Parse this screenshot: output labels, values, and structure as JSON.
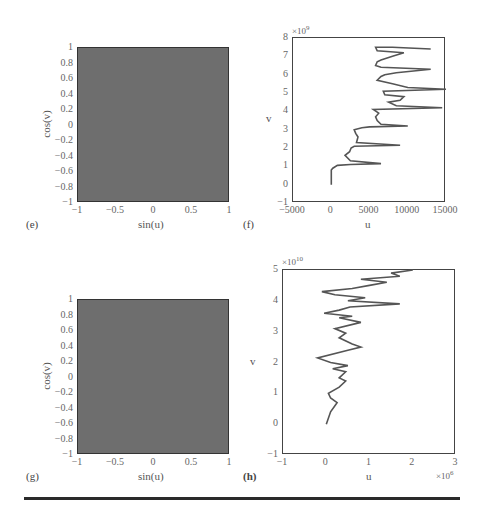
{
  "figure": {
    "panels": [
      {
        "id": "e",
        "label": "(e)",
        "xlabel": "sin(u)",
        "ylabel": "cos(v)",
        "xticks": [
          "−1",
          "−0.5",
          "0",
          "0.5",
          "1"
        ],
        "yticks": [
          "1",
          "0.8",
          "0.6",
          "0.4",
          "0.2",
          "0",
          "−0.2",
          "−0.4",
          "−0.6",
          "−0.8",
          "−1"
        ]
      },
      {
        "id": "f",
        "label": "(f)",
        "xlabel": "u",
        "ylabel": "v",
        "ymultiplier": "×10",
        "ymultiplier_exp": "9",
        "xticks": [
          "−5000",
          "0",
          "5000",
          "10000",
          "15000"
        ],
        "yticks": [
          "8",
          "7",
          "6",
          "5",
          "4",
          "3",
          "2",
          "1",
          "0",
          "−1"
        ]
      },
      {
        "id": "g",
        "label": "(g)",
        "xlabel": "sin(u)",
        "ylabel": "cos(v)",
        "xticks": [
          "−1",
          "−0.5",
          "0",
          "0.5",
          "1"
        ],
        "yticks": [
          "1",
          "0.8",
          "0.6",
          "0.4",
          "0.2",
          "0",
          "−0.2",
          "−0.4",
          "−0.6",
          "−0.8",
          "−1"
        ]
      },
      {
        "id": "h",
        "label": "(h)",
        "xlabel": "u",
        "ylabel": "v",
        "ymultiplier": "×10",
        "ymultiplier_exp": "10",
        "xmultiplier": "×10",
        "xmultiplier_exp": "6",
        "xticks": [
          "−1",
          "0",
          "1",
          "2",
          "3"
        ],
        "yticks": [
          "5",
          "4",
          "3",
          "2",
          "1",
          "0",
          "−1"
        ]
      }
    ]
  },
  "chart_data": [
    {
      "type": "heatmap",
      "panel": "(e)",
      "title": "",
      "xlabel": "sin(u)",
      "ylabel": "cos(v)",
      "xlim": [
        -1,
        1
      ],
      "ylim": [
        -1,
        1
      ],
      "description": "densely filled square (uniform gray)",
      "fill_color": "#6e6e6e"
    },
    {
      "type": "line",
      "panel": "(f)",
      "title": "",
      "xlabel": "u",
      "ylabel": "v (×10^9)",
      "xlim": [
        -5000,
        15000
      ],
      "ylim": [
        -1,
        8
      ],
      "x": [
        0,
        0,
        0,
        200,
        800,
        2500,
        6500,
        2500,
        1800,
        2400,
        2600,
        3000,
        9000,
        3300,
        3500,
        3200,
        3000,
        4000,
        5000,
        10000,
        6500,
        6000,
        5800,
        6200,
        5500,
        14500,
        8500,
        7500,
        9000,
        9500,
        7000,
        6800,
        15000,
        10000,
        8000,
        6000,
        6500,
        7000,
        8500,
        13000,
        6500,
        5800,
        6000,
        6500,
        8000,
        9500,
        6000,
        5800,
        8000,
        13000
      ],
      "y": [
        0,
        0.5,
        0.8,
        0.9,
        1.05,
        1.1,
        1.15,
        1.3,
        1.6,
        1.8,
        2.0,
        2.1,
        2.15,
        2.3,
        2.6,
        2.8,
        3.0,
        3.1,
        3.15,
        3.2,
        3.3,
        3.5,
        3.7,
        3.9,
        4.1,
        4.2,
        4.3,
        4.5,
        4.6,
        4.8,
        4.9,
        5.1,
        5.2,
        5.3,
        5.5,
        5.7,
        5.9,
        6.0,
        6.1,
        6.3,
        6.4,
        6.5,
        6.7,
        6.8,
        7.0,
        7.2,
        7.3,
        7.5,
        7.5,
        7.4
      ]
    },
    {
      "type": "heatmap",
      "panel": "(g)",
      "title": "",
      "xlabel": "sin(u)",
      "ylabel": "cos(v)",
      "xlim": [
        -1,
        1
      ],
      "ylim": [
        -1,
        1
      ],
      "description": "densely filled square (uniform gray)",
      "fill_color": "#6e6e6e"
    },
    {
      "type": "line",
      "panel": "(h)",
      "title": "",
      "xlabel": "u (×10^6)",
      "ylabel": "v (×10^10)",
      "xlim": [
        -1,
        3
      ],
      "ylim": [
        -1,
        5
      ],
      "x": [
        0,
        0.1,
        0.2,
        0.25,
        0.1,
        0.05,
        0.3,
        0.45,
        0.3,
        0.45,
        0.15,
        0.5,
        0.1,
        -0.2,
        0.5,
        0.8,
        0.6,
        0.3,
        0.45,
        0.2,
        0.8,
        0.3,
        0.6,
        -0.05,
        0.3,
        0.55,
        1.7,
        0.5,
        0.9,
        0.2,
        -0.1,
        0.6,
        1.0,
        1.4,
        0.8,
        1.7,
        1.5,
        2.0
      ],
      "y": [
        0,
        0.4,
        0.6,
        0.7,
        0.85,
        1.0,
        1.2,
        1.4,
        1.5,
        1.7,
        1.8,
        1.9,
        2.0,
        2.15,
        2.4,
        2.5,
        2.6,
        2.8,
        2.95,
        3.1,
        3.3,
        3.45,
        3.5,
        3.6,
        3.7,
        3.8,
        3.9,
        4.0,
        4.1,
        4.2,
        4.3,
        4.4,
        4.5,
        4.6,
        4.7,
        4.8,
        4.9,
        5.0
      ]
    }
  ]
}
